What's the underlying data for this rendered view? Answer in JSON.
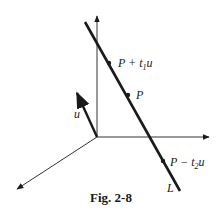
{
  "figure": {
    "caption": "Fig. 2-8",
    "line_label": "L",
    "vector_label": "u",
    "points": [
      {
        "label_main": "P + t",
        "label_sub": "1",
        "label_tail": "u",
        "x": 109,
        "y": 63
      },
      {
        "label_main": "P",
        "label_sub": "",
        "label_tail": "",
        "x": 128,
        "y": 95
      },
      {
        "label_main": "P − t",
        "label_sub": "2",
        "label_tail": "u",
        "x": 163,
        "y": 161
      }
    ],
    "colors": {
      "ink": "#1a1a1a",
      "axis": "#333333",
      "background": "#ffffff"
    }
  }
}
